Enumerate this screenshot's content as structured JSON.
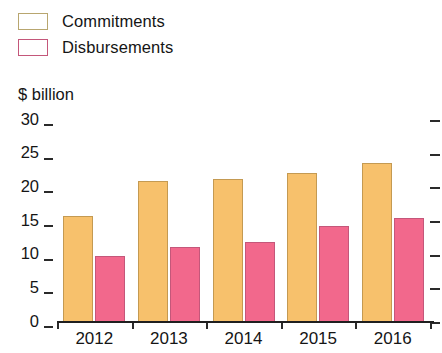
{
  "chart_data": {
    "type": "bar",
    "title": "",
    "subtitle": "",
    "xlabel": "",
    "ylabel": "$ billion",
    "categories": [
      "2012",
      "2013",
      "2014",
      "2015",
      "2016"
    ],
    "series": [
      {
        "name": "Commitments",
        "color": "#f7c16c",
        "values": [
          15.7,
          21.0,
          21.3,
          22.1,
          23.6
        ]
      },
      {
        "name": "Disbursements",
        "color": "#f2688c",
        "values": [
          9.8,
          11.1,
          11.9,
          14.2,
          15.4
        ]
      }
    ],
    "ylim": [
      0,
      30
    ],
    "yticks": [
      0,
      5,
      10,
      15,
      20,
      25,
      30
    ],
    "ytick_labels": [
      "0",
      "5",
      "10",
      "15",
      "20",
      "25",
      "30"
    ],
    "grid": false,
    "legend_position": "top-left",
    "right_axis_ticks": true,
    "annotations": []
  },
  "legend": {
    "items": [
      {
        "label": "Commitments",
        "swatch": "legend-swatch-commitments"
      },
      {
        "label": "Disbursements",
        "swatch": "legend-swatch-disbursements"
      }
    ]
  },
  "axis": {
    "unit_caption": "$ billion"
  }
}
